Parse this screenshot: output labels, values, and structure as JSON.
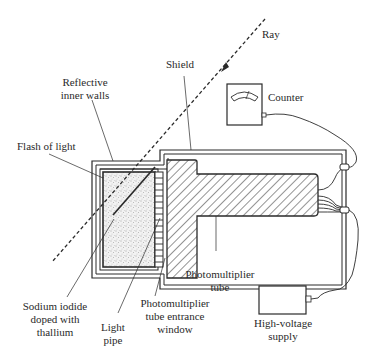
{
  "diagram": {
    "labels": {
      "ray": "Ray",
      "shield": "Shield",
      "counter": "Counter",
      "reflective": [
        "Reflective",
        "inner walls"
      ],
      "flash": "Flash of light",
      "sodium": [
        "Sodium iodide",
        "doped with",
        "thallium"
      ],
      "light_pipe": [
        "Light",
        "pipe"
      ],
      "window": [
        "Photomultiplier",
        "tube entrance",
        "window"
      ],
      "pmt": [
        "Photomultiplier",
        "tube"
      ],
      "hv": [
        "High-voltage",
        "supply"
      ]
    },
    "colors": {
      "line": "#2a2a2a",
      "background": "#ffffff",
      "crystal_fill": "#ececec"
    }
  }
}
